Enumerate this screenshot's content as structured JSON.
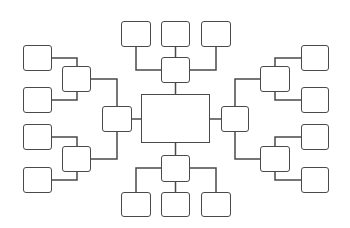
{
  "diagram": {
    "type": "mind-map-template",
    "colors": {
      "stroke": "#4a4a4a",
      "fill": "#ffffff",
      "background": "#ffffff"
    },
    "nodes": [
      {
        "id": "center",
        "label": "",
        "x": 141,
        "y": 94,
        "w": 69,
        "h": 49,
        "kind": "center"
      },
      {
        "id": "top-hub",
        "label": "",
        "x": 161,
        "y": 57,
        "w": 29,
        "h": 26
      },
      {
        "id": "top-leaf-1",
        "label": "",
        "x": 121,
        "y": 21,
        "w": 30,
        "h": 26
      },
      {
        "id": "top-leaf-2",
        "label": "",
        "x": 161,
        "y": 21,
        "w": 29,
        "h": 26
      },
      {
        "id": "top-leaf-3",
        "label": "",
        "x": 201,
        "y": 21,
        "w": 30,
        "h": 26
      },
      {
        "id": "bottom-hub",
        "label": "",
        "x": 161,
        "y": 155,
        "w": 29,
        "h": 27
      },
      {
        "id": "bottom-leaf-1",
        "label": "",
        "x": 121,
        "y": 192,
        "w": 30,
        "h": 25
      },
      {
        "id": "bottom-leaf-2",
        "label": "",
        "x": 161,
        "y": 192,
        "w": 29,
        "h": 25
      },
      {
        "id": "bottom-leaf-3",
        "label": "",
        "x": 201,
        "y": 192,
        "w": 30,
        "h": 25
      },
      {
        "id": "left-hub",
        "label": "",
        "x": 102,
        "y": 106,
        "w": 30,
        "h": 26
      },
      {
        "id": "left-sub-1",
        "label": "",
        "x": 62,
        "y": 66,
        "w": 29,
        "h": 26
      },
      {
        "id": "left-sub-2",
        "label": "",
        "x": 62,
        "y": 146,
        "w": 29,
        "h": 26
      },
      {
        "id": "left-leaf-1",
        "label": "",
        "x": 23,
        "y": 45,
        "w": 29,
        "h": 26
      },
      {
        "id": "left-leaf-2",
        "label": "",
        "x": 23,
        "y": 87,
        "w": 29,
        "h": 26
      },
      {
        "id": "left-leaf-3",
        "label": "",
        "x": 23,
        "y": 124,
        "w": 29,
        "h": 26
      },
      {
        "id": "left-leaf-4",
        "label": "",
        "x": 23,
        "y": 167,
        "w": 29,
        "h": 26
      },
      {
        "id": "right-hub",
        "label": "",
        "x": 221,
        "y": 106,
        "w": 28,
        "h": 26
      },
      {
        "id": "right-sub-1",
        "label": "",
        "x": 260,
        "y": 66,
        "w": 30,
        "h": 26
      },
      {
        "id": "right-sub-2",
        "label": "",
        "x": 260,
        "y": 146,
        "w": 30,
        "h": 26
      },
      {
        "id": "right-leaf-1",
        "label": "",
        "x": 301,
        "y": 45,
        "w": 28,
        "h": 26
      },
      {
        "id": "right-leaf-2",
        "label": "",
        "x": 301,
        "y": 87,
        "w": 28,
        "h": 26
      },
      {
        "id": "right-leaf-3",
        "label": "",
        "x": 301,
        "y": 124,
        "w": 28,
        "h": 26
      },
      {
        "id": "right-leaf-4",
        "label": "",
        "x": 301,
        "y": 167,
        "w": 28,
        "h": 26
      }
    ],
    "links": [
      {
        "from": "center",
        "to": "top-hub",
        "points": "175.5,94 175.5,83"
      },
      {
        "from": "top-hub",
        "to": "top-leaf-2",
        "points": "175.5,57 175.5,47"
      },
      {
        "from": "top-hub",
        "to": "top-leaf-1",
        "points": "161,70 136,70 136,47"
      },
      {
        "from": "top-hub",
        "to": "top-leaf-3",
        "points": "190,70 216,70 216,47"
      },
      {
        "from": "center",
        "to": "bottom-hub",
        "points": "175.5,143 175.5,155"
      },
      {
        "from": "bottom-hub",
        "to": "bottom-leaf-2",
        "points": "175.5,182 175.5,192"
      },
      {
        "from": "bottom-hub",
        "to": "bottom-leaf-1",
        "points": "161,168 136,168 136,192"
      },
      {
        "from": "bottom-hub",
        "to": "bottom-leaf-3",
        "points": "190,168 216,168 216,192"
      },
      {
        "from": "center",
        "to": "left-hub",
        "points": "141,119 132,119"
      },
      {
        "from": "left-hub",
        "to": "left-sub-1",
        "points": "117,106 117,79 91,79"
      },
      {
        "from": "left-hub",
        "to": "left-sub-2",
        "points": "117,132 117,159 91,159"
      },
      {
        "from": "left-sub-1",
        "to": "left-leaf-1",
        "points": "52,58 77,58 77,66"
      },
      {
        "from": "left-sub-1",
        "to": "left-leaf-2",
        "points": "77,92 77,100 52,100"
      },
      {
        "from": "left-sub-2",
        "to": "left-leaf-3",
        "points": "52,137 77,137 77,146"
      },
      {
        "from": "left-sub-2",
        "to": "left-leaf-4",
        "points": "77,172 77,180 52,180"
      },
      {
        "from": "center",
        "to": "right-hub",
        "points": "210,119 221,119"
      },
      {
        "from": "right-hub",
        "to": "right-sub-1",
        "points": "235,106 235,79 260,79"
      },
      {
        "from": "right-hub",
        "to": "right-sub-2",
        "points": "235,132 235,159 260,159"
      },
      {
        "from": "right-sub-1",
        "to": "right-leaf-1",
        "points": "275,66 275,58 301,58"
      },
      {
        "from": "right-sub-1",
        "to": "right-leaf-2",
        "points": "275,92 275,100 301,100"
      },
      {
        "from": "right-sub-2",
        "to": "right-leaf-3",
        "points": "275,146 275,137 301,137"
      },
      {
        "from": "right-sub-2",
        "to": "right-leaf-4",
        "points": "275,172 275,180 301,180"
      }
    ]
  }
}
